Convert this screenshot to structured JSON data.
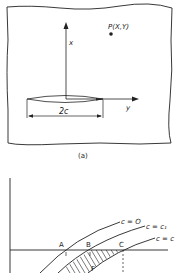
{
  "figure_a": {
    "caption": "(a)",
    "point_label": "P(X,Y)",
    "x_axis_label": "x",
    "y_axis_label": "y",
    "dimension_label": "2c"
  },
  "figure_b": {
    "points": [
      "A",
      "B",
      "C",
      "F"
    ],
    "curves": [
      {
        "label": "c = O"
      },
      {
        "label": "c = c₁"
      },
      {
        "label": "c = c"
      }
    ]
  },
  "colors": {
    "line": "#222222",
    "background": "#ffffff"
  }
}
